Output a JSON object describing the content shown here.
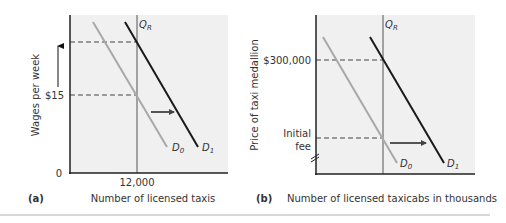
{
  "panels": [
    {
      "id": "a",
      "label": "(a)",
      "xlabel": "Number of licensed taxis",
      "ylabel": "Wages per week",
      "origin_label": "0",
      "x_tick": "12,000",
      "y_tick": "$15",
      "quota_label": "Q",
      "quota_sub": "R",
      "d0_label": "D",
      "d0_sub": "0",
      "d1_label": "D",
      "d1_sub": "1"
    },
    {
      "id": "b",
      "label": "(b)",
      "xlabel": "Number of licensed taxicabs in thousands",
      "ylabel": "Price of taxi medallion",
      "y_tick_high": "$300,000",
      "y_tick_low_line1": "Initial",
      "y_tick_low_line2": "fee",
      "quota_label": "Q",
      "quota_sub": "R",
      "d0_label": "D",
      "d0_sub": "0",
      "d1_label": "D",
      "d1_sub": "1"
    }
  ],
  "colors": {
    "plot_bg": "#f0f0f0",
    "axis": "#222222",
    "d0": "#a8a8a8",
    "d1": "#1a1a1a",
    "quota": "#555555",
    "dashed": "#444444",
    "arrow": "#555555",
    "rule": "#b0b0b0"
  }
}
